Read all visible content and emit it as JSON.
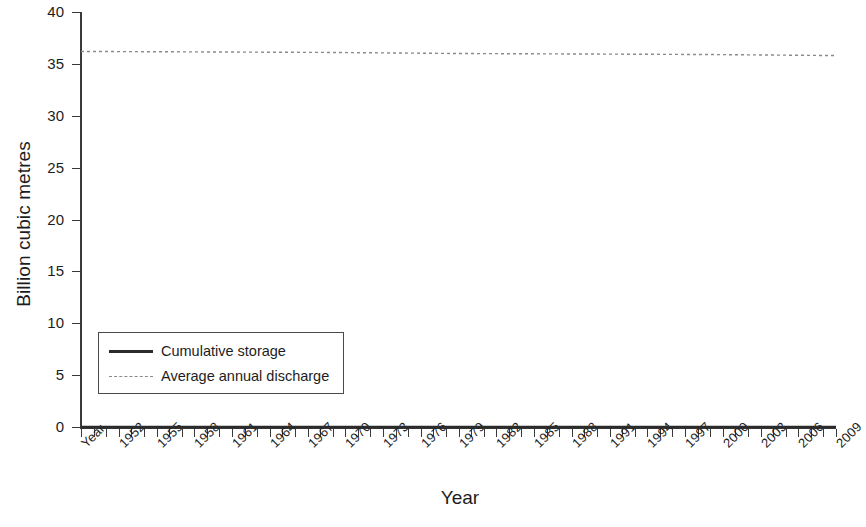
{
  "chart_data": {
    "type": "line",
    "title": "",
    "xlabel": "Year",
    "ylabel": "Billion cubic metres",
    "ylim": [
      0,
      40
    ],
    "ytick_values": [
      0,
      5,
      10,
      15,
      20,
      25,
      30,
      35,
      40
    ],
    "ytick_labels": [
      "0",
      "5",
      "10",
      "15",
      "20",
      "25",
      "30",
      "35",
      "40"
    ],
    "grid": false,
    "legend_position": "lower-left-inside",
    "x_first_label": "Year",
    "x_tick_years_start": 1951,
    "x_tick_years_end": 2011,
    "xtick_labels": [
      "Year",
      "1952",
      "1955",
      "1958",
      "1961",
      "1964",
      "1967",
      "1970",
      "1973",
      "1976",
      "1979",
      "1982",
      "1985",
      "1988",
      "1991",
      "1994",
      "1997",
      "2000",
      "2003",
      "2006",
      "2009"
    ],
    "series": [
      {
        "name": "Cumulative storage",
        "style": "solid",
        "color": "#2b2b2b",
        "x": [
          1951,
          1961,
          1971,
          1981,
          1991,
          2001,
          2011
        ],
        "values": [
          0,
          0,
          0,
          0,
          0,
          0,
          0
        ]
      },
      {
        "name": "Average annual discharge",
        "style": "dashed",
        "color": "#8a8a8a",
        "x": [
          1951,
          1961,
          1971,
          1981,
          1991,
          2001,
          2011
        ],
        "values": [
          36.2,
          36.15,
          36.1,
          36.0,
          35.95,
          35.9,
          35.8
        ]
      }
    ]
  },
  "legend": {
    "items": [
      {
        "label": "Cumulative storage"
      },
      {
        "label": "Average annual discharge"
      }
    ]
  },
  "axes": {
    "y_title": "Billion cubic metres",
    "x_title": "Year"
  }
}
